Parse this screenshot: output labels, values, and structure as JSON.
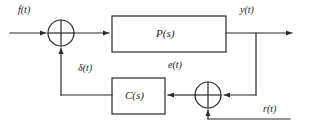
{
  "diagram": {
    "kind": "control-system-block-diagram",
    "line_color": "#2b2b2b",
    "block_fill": "#ffffff",
    "background": "#ffffff",
    "blocks": [
      {
        "id": "plant",
        "label": "P(s)",
        "x": 112,
        "y": 16,
        "w": 114,
        "h": 36
      },
      {
        "id": "controller",
        "label": "C(s)",
        "x": 112,
        "y": 78,
        "w": 53,
        "h": 36
      }
    ],
    "summing_junctions": [
      {
        "id": "input-sum",
        "cx": 61,
        "cy": 33,
        "r": 13
      },
      {
        "id": "feedback-sum",
        "cx": 208,
        "cy": 95,
        "r": 13
      }
    ],
    "signals": [
      {
        "id": "input",
        "label": "f(t)",
        "x": 18,
        "y": 5
      },
      {
        "id": "output",
        "label": "y(t)",
        "x": 240,
        "y": 5
      },
      {
        "id": "delta",
        "label": "δ(t)",
        "x": 78,
        "y": 63
      },
      {
        "id": "error",
        "label": "e(t)",
        "x": 168,
        "y": 60
      },
      {
        "id": "reference",
        "label": "r(t)",
        "x": 263,
        "y": 104
      }
    ]
  }
}
